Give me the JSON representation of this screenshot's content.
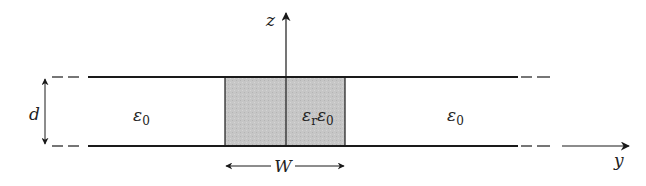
{
  "diagram": {
    "axes": {
      "vertical_label": "z",
      "horizontal_label": "y"
    },
    "dimensions": {
      "separation_label": "d",
      "width_label": "W"
    },
    "regions": {
      "left": {
        "symbol": "ε",
        "subscript": "0"
      },
      "center": {
        "symbol_r": "ε",
        "sub_r": "r",
        "symbol_0": "ε",
        "sub_0": "0"
      },
      "right": {
        "symbol": "ε",
        "subscript": "0"
      }
    },
    "colors": {
      "line": "#1a1a1a",
      "dielectric_fill": "#c8c8c8",
      "background": "#ffffff"
    }
  }
}
